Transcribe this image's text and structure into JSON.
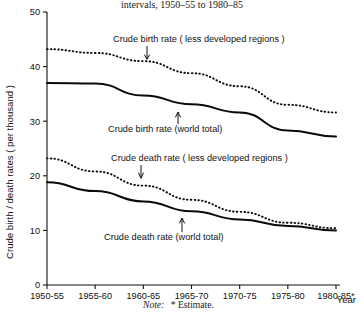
{
  "title": "intervals, 1950–55 to 1980–85",
  "note": {
    "prefix": "Note:",
    "text": "* Estimate."
  },
  "axis": {
    "ylabel": "Crude birth / death rates ( per thousand )",
    "xlabel": "Year",
    "yticks": [
      "0",
      "10",
      "20",
      "30",
      "40",
      "50"
    ],
    "xticks": [
      "1950-55",
      "1955-60",
      "1960-65",
      "1965-70",
      "1970-75",
      "1975-80",
      "1980-85*"
    ]
  },
  "annotations": {
    "birth_ldr": "Crude birth rate ( less developed regions )",
    "birth_world": "Crude birth rate (world total)",
    "death_ldr": "Crude death rate ( less developed regions )",
    "death_world": "Crude death rate (world total)"
  },
  "chart_data": {
    "type": "line",
    "title": "intervals, 1950–55 to 1980–85",
    "xlabel": "Year",
    "ylabel": "Crude birth / death rates ( per thousand )",
    "categories": [
      "1950-55",
      "1955-60",
      "1960-65",
      "1965-70",
      "1970-75",
      "1975-80",
      "1980-85*"
    ],
    "ylim": [
      0,
      50
    ],
    "yticks": [
      0,
      10,
      20,
      30,
      40,
      50
    ],
    "grid": false,
    "legend": "annotated-inline",
    "series": [
      {
        "name": "Crude birth rate ( less developed regions )",
        "style": "dotted",
        "values": [
          43.2,
          42.5,
          41.0,
          38.8,
          36.4,
          33.0,
          31.6
        ]
      },
      {
        "name": "Crude birth rate (world total)",
        "style": "solid",
        "values": [
          37.0,
          36.9,
          34.7,
          33.1,
          31.6,
          28.3,
          27.2
        ]
      },
      {
        "name": "Crude death rate ( less developed regions )",
        "style": "dotted",
        "values": [
          23.2,
          20.8,
          18.2,
          15.6,
          13.4,
          11.4,
          10.4
        ]
      },
      {
        "name": "Crude death rate (world total)",
        "style": "solid",
        "values": [
          18.8,
          17.2,
          15.3,
          13.5,
          12.0,
          10.8,
          10.0
        ]
      }
    ]
  }
}
